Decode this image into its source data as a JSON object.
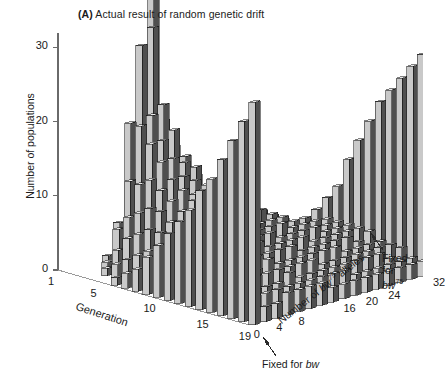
{
  "figure": {
    "panel_tag": "(A)",
    "title": "Actual result of random genetic drift"
  },
  "axes": {
    "y": {
      "label": "Number of populations",
      "ticks": [
        0,
        10,
        20,
        30
      ],
      "range": [
        0,
        32
      ]
    },
    "x": {
      "label": "Generation",
      "ticks": [
        1,
        5,
        10,
        15,
        19
      ],
      "range": [
        1,
        19
      ]
    },
    "z": {
      "label_prefix": "Number of ",
      "label_allele": "bw",
      "label_allele_sup": "75",
      "label_suffix": " alleles",
      "ticks": [
        0,
        4,
        8,
        16,
        20,
        24,
        32
      ],
      "range": [
        0,
        32
      ]
    }
  },
  "annotations": {
    "fixed_for_bw75": {
      "line1": "Fixed",
      "line2": "for",
      "allele": "bw",
      "allele_sup": "75"
    },
    "fixed_for_bw": {
      "text": "Fixed for ",
      "allele": "bw"
    }
  },
  "colors": {
    "bar_front": "#c9c9c9",
    "bar_side": "#4f4f4f",
    "bar_top": "#e8e8e8",
    "outline": "#1a1a1a",
    "axis": "#6a6a6a",
    "background": "#ffffff"
  },
  "chart_data": {
    "type": "bar",
    "title": "(A) Actual result of random genetic drift",
    "xlabel": "Generation",
    "ylabel": "Number of populations",
    "zlabel": "Number of bw75 alleles",
    "xlim": [
      1,
      19
    ],
    "ylim": [
      0,
      32
    ],
    "zlim": [
      0,
      32
    ],
    "grid": false,
    "legend": null,
    "note": "3D histogram (Buri 1956 Drosophila drift experiment): 19 generations x 17 allele-count bins (0,2,...,32). Each value = number of populations (of 107) in that bw75 allele-count class.",
    "generations": [
      1,
      2,
      3,
      4,
      5,
      6,
      7,
      8,
      9,
      10,
      11,
      12,
      13,
      14,
      15,
      16,
      17,
      18,
      19
    ],
    "allele_bins": [
      0,
      2,
      4,
      6,
      8,
      10,
      12,
      14,
      16,
      18,
      20,
      22,
      24,
      26,
      28,
      30,
      32
    ],
    "series": [
      {
        "name": "Generation 1",
        "values": [
          0,
          0,
          0,
          0,
          0,
          0,
          0,
          0,
          107,
          0,
          0,
          0,
          0,
          0,
          0,
          0,
          0
        ]
      },
      {
        "name": "Generation 2",
        "values": [
          0,
          0,
          0,
          1,
          5,
          18,
          28,
          30,
          17,
          5,
          3,
          0,
          0,
          0,
          0,
          0,
          0
        ]
      },
      {
        "name": "Generation 3",
        "values": [
          0,
          0,
          1,
          5,
          11,
          18,
          19,
          20,
          14,
          10,
          6,
          2,
          1,
          0,
          0,
          0,
          0
        ]
      },
      {
        "name": "Generation 4",
        "values": [
          0,
          1,
          3,
          7,
          11,
          16,
          16,
          17,
          13,
          10,
          8,
          3,
          2,
          0,
          0,
          0,
          0
        ]
      },
      {
        "name": "Generation 5",
        "values": [
          0,
          2,
          5,
          8,
          12,
          14,
          14,
          13,
          12,
          9,
          8,
          5,
          3,
          2,
          0,
          0,
          0
        ]
      },
      {
        "name": "Generation 6",
        "values": [
          1,
          3,
          6,
          9,
          11,
          12,
          12,
          11,
          10,
          9,
          8,
          6,
          4,
          3,
          1,
          1,
          1
        ]
      },
      {
        "name": "Generation 7",
        "values": [
          2,
          4,
          7,
          9,
          10,
          11,
          10,
          10,
          9,
          8,
          7,
          6,
          5,
          4,
          2,
          1,
          2
        ]
      },
      {
        "name": "Generation 8",
        "values": [
          3,
          5,
          7,
          8,
          9,
          10,
          9,
          9,
          8,
          8,
          7,
          6,
          5,
          4,
          3,
          2,
          4
        ]
      },
      {
        "name": "Generation 9",
        "values": [
          5,
          5,
          7,
          8,
          8,
          9,
          8,
          8,
          7,
          7,
          7,
          6,
          5,
          4,
          4,
          3,
          6
        ]
      },
      {
        "name": "Generation 10",
        "values": [
          7,
          6,
          6,
          7,
          7,
          8,
          8,
          7,
          7,
          6,
          6,
          6,
          5,
          5,
          4,
          4,
          8
        ]
      },
      {
        "name": "Generation 11",
        "values": [
          9,
          6,
          6,
          6,
          7,
          7,
          7,
          6,
          6,
          6,
          6,
          5,
          5,
          5,
          4,
          4,
          12
        ]
      },
      {
        "name": "Generation 12",
        "values": [
          11,
          6,
          5,
          6,
          6,
          6,
          6,
          6,
          6,
          5,
          5,
          5,
          5,
          4,
          4,
          4,
          15
        ]
      },
      {
        "name": "Generation 13",
        "values": [
          13,
          5,
          5,
          5,
          5,
          6,
          6,
          5,
          5,
          5,
          5,
          4,
          4,
          4,
          4,
          4,
          18
        ]
      },
      {
        "name": "Generation 14",
        "values": [
          16,
          5,
          4,
          5,
          5,
          5,
          5,
          5,
          5,
          4,
          4,
          4,
          4,
          4,
          3,
          4,
          21
        ]
      },
      {
        "name": "Generation 15",
        "values": [
          18,
          4,
          4,
          4,
          4,
          5,
          4,
          4,
          4,
          4,
          4,
          4,
          3,
          3,
          3,
          3,
          23
        ]
      },
      {
        "name": "Generation 16",
        "values": [
          21,
          4,
          3,
          4,
          4,
          4,
          4,
          4,
          4,
          3,
          3,
          3,
          3,
          3,
          3,
          3,
          25
        ]
      },
      {
        "name": "Generation 17",
        "values": [
          24,
          3,
          3,
          3,
          3,
          4,
          3,
          3,
          3,
          3,
          3,
          3,
          3,
          3,
          2,
          3,
          27
        ]
      },
      {
        "name": "Generation 18",
        "values": [
          27,
          3,
          3,
          3,
          3,
          3,
          3,
          3,
          3,
          3,
          2,
          2,
          2,
          2,
          2,
          2,
          29
        ]
      },
      {
        "name": "Generation 19",
        "values": [
          30,
          2,
          2,
          3,
          3,
          3,
          3,
          2,
          2,
          2,
          2,
          2,
          2,
          2,
          2,
          2,
          30
        ]
      }
    ]
  }
}
